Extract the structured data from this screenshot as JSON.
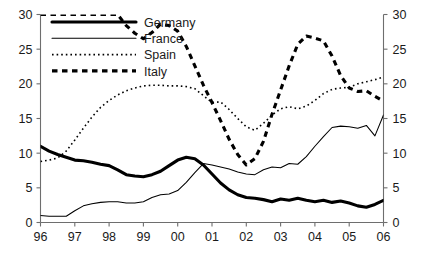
{
  "chart_data": {
    "type": "line",
    "title": "",
    "subtitle": "",
    "xlabel": "",
    "ylabel": "",
    "xlim": [
      1996,
      2006
    ],
    "ylim": [
      0,
      30
    ],
    "grid": false,
    "legend_position": "top-left",
    "dual_y_axis": true,
    "x_tick_labels": [
      "96",
      "97",
      "98",
      "99",
      "00",
      "01",
      "02",
      "03",
      "04",
      "05",
      "06"
    ],
    "x_tick_values": [
      1996,
      1997,
      1998,
      1999,
      2000,
      2001,
      2002,
      2003,
      2004,
      2005,
      2006
    ],
    "y_tick_labels_left": [
      "0",
      "5",
      "10",
      "15",
      "20",
      "25",
      "30"
    ],
    "y_tick_labels_right": [
      "0",
      "5",
      "10",
      "15",
      "20",
      "25",
      "30"
    ],
    "y_tick_values": [
      0,
      5,
      10,
      15,
      20,
      25,
      30
    ],
    "x": [
      1996.0,
      1996.25,
      1996.5,
      1996.75,
      1997.0,
      1997.25,
      1997.5,
      1997.75,
      1998.0,
      1998.25,
      1998.5,
      1998.75,
      1999.0,
      1999.25,
      1999.5,
      1999.75,
      2000.0,
      2000.25,
      2000.5,
      2000.75,
      2001.0,
      2001.25,
      2001.5,
      2001.75,
      2002.0,
      2002.25,
      2002.5,
      2002.75,
      2003.0,
      2003.25,
      2003.5,
      2003.75,
      2004.0,
      2004.25,
      2004.5,
      2004.75,
      2005.0,
      2005.25,
      2005.5,
      2005.75,
      2006.0
    ],
    "series": [
      {
        "name": "Germany",
        "style": "thick-solid",
        "color": "#000000",
        "values": [
          11.0,
          10.3,
          9.8,
          9.4,
          9.0,
          8.9,
          8.7,
          8.4,
          8.2,
          7.6,
          6.9,
          6.7,
          6.6,
          6.9,
          7.4,
          8.2,
          9.0,
          9.4,
          9.2,
          8.3,
          7.0,
          5.7,
          4.7,
          4.0,
          3.6,
          3.5,
          3.3,
          3.0,
          3.4,
          3.2,
          3.5,
          3.2,
          3.0,
          3.2,
          2.9,
          3.1,
          2.8,
          2.4,
          2.2,
          2.6,
          3.2
        ]
      },
      {
        "name": "France",
        "style": "thin-solid",
        "color": "#000000",
        "values": [
          1.0,
          0.9,
          0.9,
          0.9,
          1.7,
          2.4,
          2.7,
          2.9,
          3.0,
          3.0,
          2.8,
          2.8,
          3.0,
          3.6,
          4.0,
          4.1,
          4.6,
          5.8,
          7.2,
          8.5,
          8.3,
          8.0,
          7.7,
          7.3,
          7.0,
          6.9,
          7.6,
          8.0,
          7.9,
          8.5,
          8.4,
          9.5,
          11.0,
          12.4,
          13.7,
          13.9,
          13.8,
          13.6,
          14.0,
          12.5,
          15.5
        ]
      },
      {
        "name": "Spain",
        "style": "dotted",
        "color": "#000000",
        "values": [
          8.8,
          9.0,
          9.3,
          10.3,
          11.9,
          13.6,
          15.2,
          16.6,
          17.6,
          18.4,
          19.0,
          19.4,
          19.7,
          19.8,
          19.8,
          19.7,
          19.7,
          19.6,
          19.3,
          18.3,
          17.3,
          17.4,
          16.3,
          15.0,
          13.8,
          13.3,
          14.3,
          15.5,
          16.4,
          16.7,
          16.4,
          16.8,
          17.6,
          18.6,
          19.2,
          19.4,
          19.5,
          20.0,
          20.3,
          20.6,
          21.0
        ]
      },
      {
        "name": "Italy",
        "style": "thick-dashed",
        "color": "#000000",
        "values": [
          30.0,
          30.0,
          30.0,
          30.0,
          30.0,
          30.0,
          30.0,
          30.0,
          30.0,
          30.0,
          28.4,
          27.3,
          26.5,
          27.4,
          28.6,
          28.4,
          27.6,
          25.4,
          22.6,
          19.8,
          17.3,
          14.7,
          12.0,
          9.8,
          8.3,
          9.2,
          11.7,
          15.6,
          19.1,
          22.6,
          25.7,
          26.9,
          26.6,
          26.2,
          24.0,
          21.2,
          19.4,
          18.9,
          19.0,
          18.2,
          17.5
        ]
      }
    ],
    "series_truncation_note": {
      "Italy": "series visible only from 1998.5 onward; earlier points off the top of the plot area"
    }
  },
  "legend": {
    "entries": [
      {
        "label": "Germany",
        "style": "thick-solid"
      },
      {
        "label": "France",
        "style": "thin-solid"
      },
      {
        "label": "Spain",
        "style": "dotted"
      },
      {
        "label": "Italy",
        "style": "thick-dashed"
      }
    ]
  }
}
